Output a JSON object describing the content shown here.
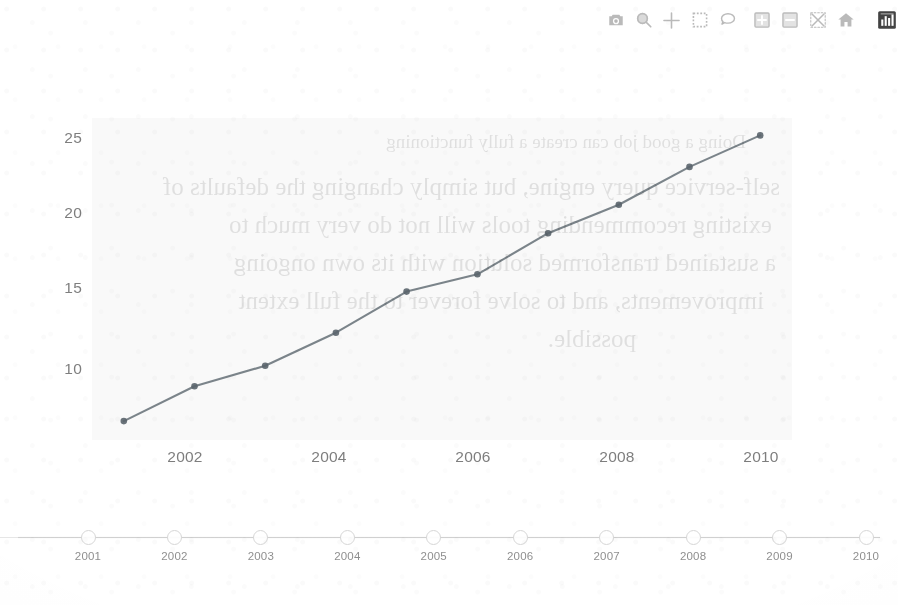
{
  "modebar": {
    "buttons": [
      {
        "name": "download-plot-camera-icon",
        "title": "Download plot as a png",
        "active": false
      },
      {
        "name": "zoom-magnifier-icon",
        "title": "Zoom",
        "active": false
      },
      {
        "name": "pan-crosshair-icon",
        "title": "Pan",
        "active": false
      },
      {
        "name": "box-select-icon",
        "title": "Box Select",
        "active": false
      },
      {
        "name": "lasso-select-icon",
        "title": "Lasso Select",
        "active": false
      },
      {
        "name": "zoom-in-plus-icon",
        "title": "Zoom in",
        "active": false
      },
      {
        "name": "zoom-out-minus-icon",
        "title": "Zoom out",
        "active": false
      },
      {
        "name": "autoscale-icon",
        "title": "Autoscale",
        "active": false
      },
      {
        "name": "reset-axes-home-icon",
        "title": "Reset axes",
        "active": false
      },
      {
        "name": "toggle-spikelines-icon",
        "title": "Toggle Spike Lines",
        "active": true
      }
    ]
  },
  "colors": {
    "line": "#5f6a72",
    "marker": "#5a646b",
    "plot_background": "#f4f4f4",
    "tick_text": "#4d4d4d",
    "slider_track": "#d8d8d8",
    "slider_handle_fill": "#ffffff",
    "slider_handle_border": "#d2d2d2",
    "slider_label": "#6f6f6f"
  },
  "chart_data": {
    "type": "line",
    "title": "",
    "xlabel": "",
    "ylabel": "",
    "grid": false,
    "legend": null,
    "x": [
      2001,
      2002,
      2003,
      2004,
      2005,
      2006,
      2007,
      2008,
      2009,
      2010
    ],
    "values": [
      6.7,
      8.9,
      10.2,
      12.3,
      14.9,
      16.0,
      18.6,
      20.4,
      22.8,
      24.8
    ],
    "series": [
      {
        "name": "",
        "values": [
          6.7,
          8.9,
          10.2,
          12.3,
          14.9,
          16.0,
          18.6,
          20.4,
          22.8,
          24.8
        ]
      }
    ],
    "xlim": [
      2000.55,
      2010.45
    ],
    "ylim": [
      5.5,
      25.9
    ],
    "ytick_labels": [
      "25",
      "20",
      "15",
      "10"
    ],
    "ytick_values": [
      25,
      20,
      15,
      10
    ],
    "xtick_labels": [
      "2002",
      "2004",
      "2006",
      "2008",
      "2010"
    ],
    "xtick_values": [
      2002,
      2004,
      2006,
      2008,
      2010
    ],
    "markers": true,
    "mode": "lines+markers"
  },
  "rangeslider": {
    "labels": [
      "2001",
      "2002",
      "2003",
      "2004",
      "2005",
      "2006",
      "2007",
      "2008",
      "2009",
      "2010"
    ],
    "handle_positions": [
      2001,
      2002,
      2003,
      2004,
      2005,
      2006,
      2007,
      2008,
      2009,
      2010
    ],
    "selected_range": [
      "2001",
      "2010"
    ]
  },
  "ghost_text": {
    "lines": [
      "Doing a good job can create a fully functioning",
      "self-service query engine, but simply changing the defaults of",
      "existing recommending tools will not do very much to",
      "a sustained transformed solution with its own ongoing",
      "improvements, and to solve forever to the full extent",
      "possible."
    ]
  }
}
